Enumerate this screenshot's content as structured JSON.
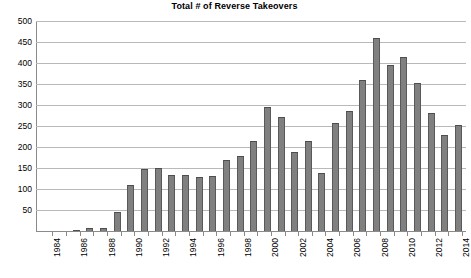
{
  "chart_data": {
    "type": "bar",
    "title": "Total # of Reverse Takeovers",
    "xlabel": "",
    "ylabel": "",
    "ylim": [
      0,
      500
    ],
    "ytick_step": 50,
    "yticks": [
      0,
      50,
      100,
      150,
      200,
      250,
      300,
      350,
      400,
      450,
      500
    ],
    "ytick_labels": [
      "",
      "50",
      "100",
      "150",
      "200",
      "250",
      "300",
      "350",
      "400",
      "450",
      "500"
    ],
    "grid": "horizontal",
    "legend": "none",
    "xtick_label_rotation": -90,
    "xtick_label_interval": 2,
    "categories": [
      "1984",
      "1985",
      "1986",
      "1987",
      "1988",
      "1989",
      "1990",
      "1991",
      "1992",
      "1993",
      "1994",
      "1995",
      "1996",
      "1997",
      "1998",
      "1999",
      "2000",
      "2001",
      "2002",
      "2003",
      "2004",
      "2005",
      "2006",
      "2007",
      "2008",
      "2009",
      "2010",
      "2011",
      "2012",
      "2013",
      "2014"
    ],
    "values": [
      0,
      0,
      3,
      8,
      7,
      45,
      110,
      147,
      150,
      133,
      133,
      128,
      130,
      168,
      178,
      215,
      295,
      272,
      188,
      215,
      138,
      258,
      285,
      360,
      460,
      395,
      415,
      352,
      280,
      228,
      252
    ],
    "colors": {
      "bar_fill": "#808080",
      "bar_edge": "#595959",
      "gridline": "#b9b9b9",
      "axis": "#8a8a8a",
      "background": "#ffffff",
      "text": "#000000"
    }
  }
}
